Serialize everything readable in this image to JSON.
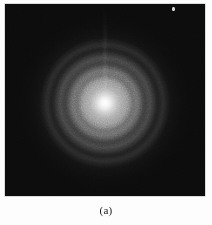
{
  "figure": {
    "caption": "(a)",
    "panel_label": "(a)",
    "page_background": "#fdfdfd",
    "plate": {
      "background": "#0b0b0b",
      "border_color": "#b9b9b9",
      "left": 5,
      "top": 4,
      "width": 200,
      "height": 192
    },
    "beam_center": {
      "x": 100,
      "y": 99
    },
    "speck": {
      "x": 167,
      "y": 3,
      "label": "bright-speck"
    }
  },
  "chart_data": {
    "type": "heatmap",
    "title": "(a)",
    "subtitle": "",
    "xlabel": "",
    "ylabel": "",
    "colormap": "grayscale",
    "value_range": [
      0,
      255
    ],
    "center": {
      "x": 100,
      "y": 99
    },
    "radial_profile": {
      "radius_px": [
        0,
        4,
        8,
        14,
        20,
        26,
        30,
        36,
        42,
        48,
        55,
        64,
        74,
        86,
        100,
        120
      ],
      "intensity": [
        255,
        250,
        238,
        214,
        192,
        172,
        166,
        148,
        136,
        118,
        104,
        80,
        58,
        38,
        22,
        13
      ]
    },
    "rings": [
      {
        "name": "halo-1",
        "radius_px": 20,
        "peak_intensity": 192,
        "width_px": 9
      },
      {
        "name": "halo-2",
        "radius_px": 31,
        "peak_intensity": 165,
        "width_px": 9
      },
      {
        "name": "halo-3",
        "radius_px": 43,
        "peak_intensity": 134,
        "width_px": 10
      },
      {
        "name": "halo-4",
        "radius_px": 56,
        "peak_intensity": 102,
        "width_px": 11
      }
    ],
    "background_intensity": 13,
    "grid": false,
    "legend": false,
    "axes_visible": false
  }
}
